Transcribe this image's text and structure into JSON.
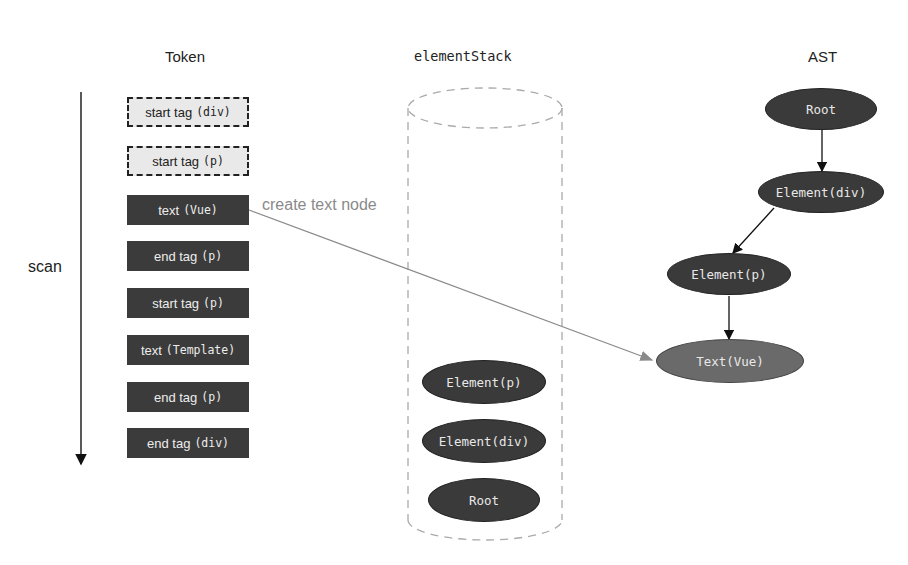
{
  "headers": {
    "token": "Token",
    "element_stack": "elementStack",
    "ast": "AST"
  },
  "scan_label": "scan",
  "arrow_label": "create text node",
  "tokens": [
    {
      "label": "start tag",
      "code": "(div)",
      "style": "dashed"
    },
    {
      "label": "start tag",
      "code": "(p)",
      "style": "dashed"
    },
    {
      "label": "text",
      "code": "(Vue)",
      "style": "dark"
    },
    {
      "label": "end tag",
      "code": "(p)",
      "style": "dark"
    },
    {
      "label": "start tag",
      "code": "(p)",
      "style": "dark"
    },
    {
      "label": "text",
      "code": "(Template)",
      "style": "dark"
    },
    {
      "label": "end tag",
      "code": "(p)",
      "style": "dark"
    },
    {
      "label": "end tag",
      "code": "(div)",
      "style": "dark"
    }
  ],
  "stack": [
    {
      "label": "Element(p)"
    },
    {
      "label": "Element(div)"
    },
    {
      "label": "Root"
    }
  ],
  "ast": {
    "nodes": [
      {
        "id": "root",
        "label": "Root"
      },
      {
        "id": "div",
        "label": "Element(div)"
      },
      {
        "id": "p",
        "label": "Element(p)"
      },
      {
        "id": "text",
        "label": "Text(Vue)",
        "highlighted": true
      }
    ],
    "edges": [
      {
        "from": "root",
        "to": "div"
      },
      {
        "from": "div",
        "to": "p"
      },
      {
        "from": "p",
        "to": "text"
      }
    ]
  },
  "colors": {
    "dark_node": "#3a3a3a",
    "highlight_node": "#6a6a6a",
    "dashed_token_bg": "#e9e9e9",
    "arrow_gray": "#8a8a8a"
  }
}
